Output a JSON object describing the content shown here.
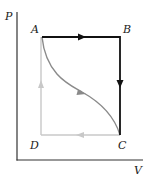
{
  "diagram": {
    "type": "PV-diagram",
    "axes": {
      "y_label": "P",
      "x_label": "V"
    },
    "points": {
      "A": "A",
      "B": "B",
      "C": "C",
      "D": "D"
    },
    "paths": [
      {
        "name": "A-B",
        "from": "A",
        "to": "B",
        "style": "black",
        "arrow": "right"
      },
      {
        "name": "B-C",
        "from": "B",
        "to": "C",
        "style": "black",
        "arrow": "down"
      },
      {
        "name": "A-C curve",
        "from": "A",
        "to": "C",
        "style": "gray",
        "arrow": "down-right"
      },
      {
        "name": "C-D",
        "from": "C",
        "to": "D",
        "style": "light-gray",
        "arrow": "left"
      },
      {
        "name": "D-A",
        "from": "D",
        "to": "A",
        "style": "light-gray",
        "arrow": "up"
      }
    ],
    "colors": {
      "axis": "#333333",
      "black_path": "#111111",
      "curve": "#8a8a8a",
      "light_path": "#c8c8c8"
    }
  }
}
